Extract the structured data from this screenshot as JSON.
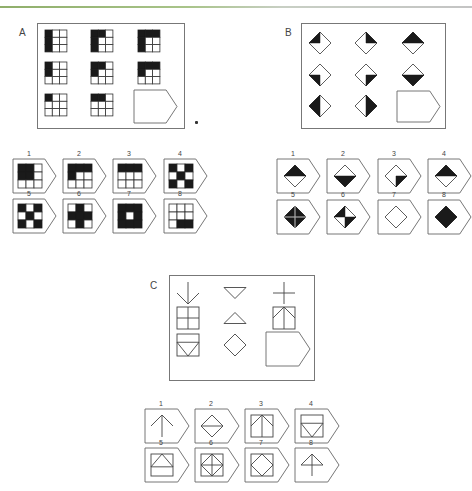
{
  "colors": {
    "ink": "#1a1a1a",
    "stroke": "#444444",
    "frame": "#777777",
    "accent_bar": "#8fae6a"
  },
  "puzzles": {
    "A": {
      "label": "A",
      "description": "3x3 matrix of 3x3 grids; black cells fill pattern; ninth cell blank (answer slot)",
      "matrix": [
        {
          "filled": [
            0,
            3,
            6
          ]
        },
        {
          "filled": [
            0,
            1,
            3,
            6
          ]
        },
        {
          "filled": [
            0,
            1,
            2,
            3,
            6
          ]
        },
        {
          "filled": [
            0,
            3
          ]
        },
        {
          "filled": [
            0,
            1,
            3
          ]
        },
        {
          "filled": [
            0,
            1,
            2,
            3
          ]
        },
        {
          "filled": [
            0
          ]
        },
        {
          "filled": [
            0,
            1
          ]
        },
        {
          "filled": null
        }
      ],
      "options": [
        {
          "n": "1",
          "filled": [
            0,
            1,
            3,
            4
          ]
        },
        {
          "n": "2",
          "filled": [
            0,
            1,
            2,
            3
          ]
        },
        {
          "n": "3",
          "filled": [
            0,
            1,
            2
          ]
        },
        {
          "n": "4",
          "filled": [
            0,
            2,
            4,
            6,
            8
          ]
        },
        {
          "n": "5",
          "filled": [
            0,
            2,
            4,
            6,
            8
          ]
        },
        {
          "n": "6",
          "filled": [
            1,
            3,
            4,
            5,
            7
          ]
        },
        {
          "n": "7",
          "filled": [
            0,
            1,
            2,
            3,
            5,
            6,
            7,
            8
          ],
          "center_small_white": true
        },
        {
          "n": "8",
          "filled": [
            7,
            8
          ]
        }
      ]
    },
    "B": {
      "label": "B",
      "description": "3x3 matrix of diamonds with black halves/quarters; ninth cell blank",
      "matrix": [
        {
          "fill": "q-tl"
        },
        {
          "fill": "q-tr"
        },
        {
          "fill": "h-top"
        },
        {
          "fill": "q-bl"
        },
        {
          "fill": "q-br"
        },
        {
          "fill": "h-bottom"
        },
        {
          "fill": "h-left"
        },
        {
          "fill": "h-right"
        },
        {
          "fill": null
        }
      ],
      "options": [
        {
          "n": "1",
          "fill": "h-top"
        },
        {
          "n": "2",
          "fill": "h-bottom"
        },
        {
          "n": "3",
          "fill": "q-br"
        },
        {
          "n": "4",
          "fill": "h-top"
        },
        {
          "n": "5",
          "fill": "full-cross"
        },
        {
          "n": "6",
          "fill": "q-tl-br"
        },
        {
          "n": "7",
          "fill": "none"
        },
        {
          "n": "8",
          "fill": "full"
        }
      ]
    },
    "C": {
      "label": "C",
      "description": "3x3 matrix of line figures; row3 col3 blank answer slot",
      "matrix": [
        {
          "shape": "arrow-down"
        },
        {
          "shape": "triangle-down"
        },
        {
          "shape": "plus"
        },
        {
          "shape": "square-plus"
        },
        {
          "shape": "triangle-up"
        },
        {
          "shape": "square-arrow-up"
        },
        {
          "shape": "square-triangle-down-bar"
        },
        {
          "shape": "diamond"
        },
        {
          "shape": null
        }
      ],
      "options": [
        {
          "n": "1",
          "shape": "arrow-up"
        },
        {
          "n": "2",
          "shape": "diamond-hbar"
        },
        {
          "n": "3",
          "shape": "square-arrow-up"
        },
        {
          "n": "4",
          "shape": "square-triangle-down-bar"
        },
        {
          "n": "5",
          "shape": "square-triangle-up-bar"
        },
        {
          "n": "6",
          "shape": "square-diamond-plus"
        },
        {
          "n": "7",
          "shape": "square-diamond"
        },
        {
          "n": "8",
          "shape": "triangle-up-stem"
        }
      ]
    }
  }
}
